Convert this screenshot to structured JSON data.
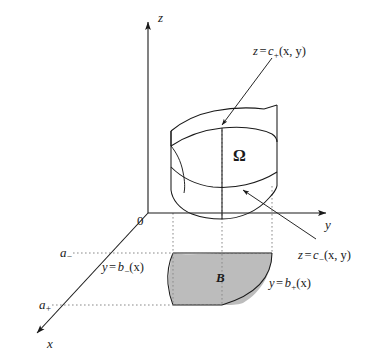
{
  "figure": {
    "type": "3d-region-diagram",
    "background_color": "#ffffff",
    "line_color": "#1a1a1a",
    "guide_line_color": "#8a8a8a",
    "shade_color": "#b8b8b8"
  },
  "axes": {
    "z_label": "z",
    "y_label": "y",
    "x_label": "x",
    "origin_label": "0"
  },
  "labels": {
    "solid": "Ω",
    "base_region": "B",
    "upper_surface": {
      "lhs": "z",
      "equals": "=",
      "fn": "c",
      "sub": "+",
      "args": "(x, y)",
      "full": "z = c₊(x, y)"
    },
    "lower_surface": {
      "lhs": "z",
      "equals": "=",
      "fn": "c",
      "sub": "−",
      "args": "(x, y)",
      "full": "z = c₋(x, y)"
    },
    "left_boundary": {
      "lhs": "y",
      "equals": "=",
      "fn": "b",
      "sub": "−",
      "args": "(x)",
      "full": "y = b₋(x)"
    },
    "right_boundary": {
      "lhs": "y",
      "equals": "=",
      "fn": "b",
      "sub": "+",
      "args": "(x)",
      "full": "y = b₊(x)"
    },
    "x_lower_limit": {
      "base": "a",
      "sub": "−",
      "full": "a₋"
    },
    "x_upper_limit": {
      "base": "a",
      "sub": "+",
      "full": "a₊"
    }
  },
  "geometry": {
    "origin_px": [
      148,
      213
    ],
    "z_axis_top_px": [
      148,
      18
    ],
    "y_axis_end_px": [
      330,
      213
    ],
    "x_axis_end_px": [
      33,
      337
    ],
    "guide_verticals_x_px": [
      173,
      222,
      272
    ],
    "guide_horizontal_a_minus_y_px": 253,
    "guide_horizontal_a_plus_y_px": 305
  }
}
